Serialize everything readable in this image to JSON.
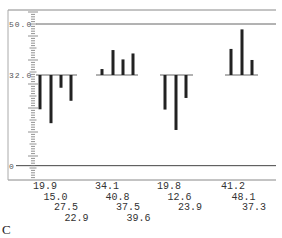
{
  "chart_data": {
    "type": "bar",
    "title": "",
    "panel_label": "C",
    "xlabel": "",
    "ylabel": "",
    "baseline": 32.0,
    "ylim": [
      0,
      50
    ],
    "y_tick_labels": [
      "50.0",
      "32.0",
      "0"
    ],
    "grid": false,
    "legend": null,
    "groups": [
      {
        "name": "Group 1",
        "values": [
          19.9,
          15.0,
          27.5,
          22.9
        ]
      },
      {
        "name": "Group 2",
        "values": [
          34.1,
          40.8,
          37.5,
          39.6
        ]
      },
      {
        "name": "Group 3",
        "values": [
          19.8,
          12.6,
          23.9
        ]
      },
      {
        "name": "Group 4",
        "values": [
          41.2,
          48.1,
          37.3
        ]
      }
    ],
    "bar_color": "#222222",
    "line_color": "#666666"
  }
}
